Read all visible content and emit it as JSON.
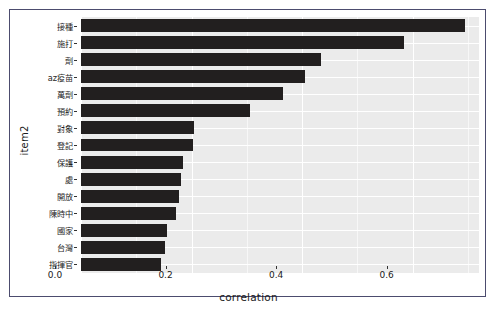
{
  "chart_data": {
    "type": "bar",
    "orientation": "horizontal",
    "title": "",
    "xlabel": "correlation",
    "ylabel": "item2",
    "xlim": [
      0.0,
      0.72
    ],
    "xticks": [
      "0.0",
      "0.2",
      "0.4",
      "0.6"
    ],
    "xtick_values": [
      0.0,
      0.2,
      0.4,
      0.6
    ],
    "grid": true,
    "legend": null,
    "bar_color": "#221f1f",
    "panel_color": "#ebebeb",
    "gridline_color": "#ffffff",
    "frame_color": "#4c4c6e",
    "categories": [
      "接種",
      "施打",
      "劑",
      "az疫苗",
      "萬劑",
      "預約",
      "對象",
      "登記",
      "保護",
      "處",
      "開放",
      "陳時中",
      "國家",
      "台灣",
      "指揮官"
    ],
    "values": [
      0.695,
      0.585,
      0.435,
      0.405,
      0.365,
      0.305,
      0.205,
      0.203,
      0.185,
      0.18,
      0.178,
      0.172,
      0.155,
      0.152,
      0.145
    ]
  }
}
